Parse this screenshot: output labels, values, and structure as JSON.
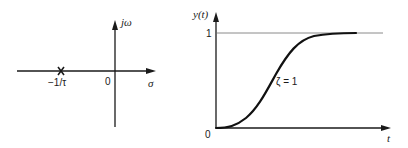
{
  "pole_plot": {
    "vertical_axis_label": "jω",
    "horizontal_axis_label": "σ",
    "origin_label": "0",
    "pole_label": "−1/τ",
    "pole_marker": "×",
    "pole_location": "-1/tau"
  },
  "response_plot": {
    "y_axis_label": "y(t)",
    "x_axis_label": "t",
    "origin_label": "0",
    "steady_state_label": "1",
    "curve_label": "ζ = 1"
  },
  "colors": {
    "axis": "#1a1a1a",
    "curve": "#111111",
    "asymptote": "#8a8a8a"
  }
}
